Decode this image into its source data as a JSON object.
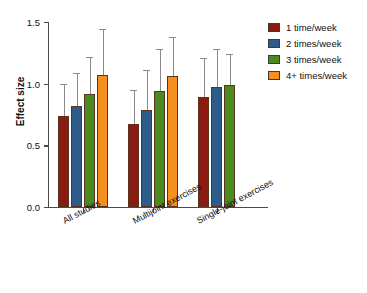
{
  "chart_data": {
    "type": "bar",
    "title": "",
    "xlabel": "",
    "ylabel": "Effect size",
    "ylim": [
      0.0,
      1.5
    ],
    "yticks": [
      "0.0",
      "0.5",
      "1.0",
      "1.5"
    ],
    "ytick_values": [
      0.0,
      0.5,
      1.0,
      1.5
    ],
    "grid": false,
    "legend_position": "right",
    "categories": [
      "All studies",
      "Multijoint exercises",
      "Single-joint exercises"
    ],
    "series": [
      {
        "name": "1 time/week",
        "color": "#8B1A10",
        "values": [
          0.74,
          0.67,
          0.89
        ],
        "err_upper": [
          1.0,
          0.95,
          1.21
        ],
        "err_lower": [
          0.74,
          0.67,
          0.89
        ]
      },
      {
        "name": "2 times/week",
        "color": "#2E5C8A",
        "values": [
          0.82,
          0.79,
          0.97
        ],
        "err_upper": [
          1.09,
          1.11,
          1.28
        ],
        "err_lower": [
          0.82,
          0.79,
          0.97
        ]
      },
      {
        "name": "3 times/week",
        "color": "#4A8B1F",
        "values": [
          0.92,
          0.94,
          0.99
        ],
        "err_upper": [
          1.22,
          1.28,
          1.24
        ],
        "err_lower": [
          0.92,
          0.94,
          0.99
        ]
      },
      {
        "name": "4+ times/week",
        "color": "#F5901E",
        "values": [
          1.07,
          1.06,
          null
        ],
        "err_upper": [
          1.44,
          1.38,
          null
        ],
        "err_lower": [
          1.07,
          1.06,
          null
        ]
      }
    ]
  },
  "legend": {
    "items": [
      {
        "label": "1 time/week",
        "color": "#8B1A10"
      },
      {
        "label": "2 times/week",
        "color": "#2E5C8A"
      },
      {
        "label": "3 times/week",
        "color": "#4A8B1F"
      },
      {
        "label": "4+ times/week",
        "color": "#F5901E"
      }
    ]
  },
  "axes": {
    "y_label": "Effect size",
    "y_ticks": [
      "0.0",
      "0.5",
      "1.0",
      "1.5"
    ],
    "x_categories": [
      "All studies",
      "Multijoint exercises",
      "Single-joint exercises"
    ]
  }
}
